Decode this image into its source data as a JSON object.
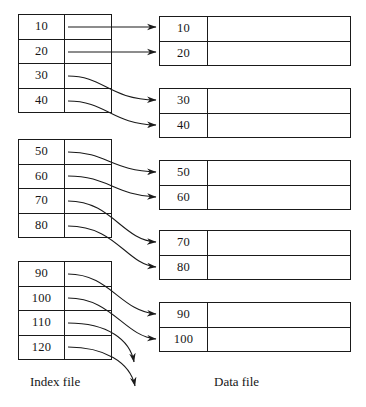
{
  "diagram": {
    "title_labels": {
      "index_file": "Index file",
      "data_file": "Data file"
    },
    "index_file": {
      "blocks": [
        {
          "id": "index-block-1",
          "entries": [
            {
              "key": "10",
              "pointer_icon": "pointer-stub"
            },
            {
              "key": "20",
              "pointer_icon": "pointer-stub"
            },
            {
              "key": "30",
              "pointer_icon": "pointer-stub"
            },
            {
              "key": "40",
              "pointer_icon": "pointer-stub"
            }
          ]
        },
        {
          "id": "index-block-2",
          "entries": [
            {
              "key": "50",
              "pointer_icon": "pointer-stub"
            },
            {
              "key": "60",
              "pointer_icon": "pointer-stub"
            },
            {
              "key": "70",
              "pointer_icon": "pointer-stub"
            },
            {
              "key": "80",
              "pointer_icon": "pointer-stub"
            }
          ]
        },
        {
          "id": "index-block-3",
          "entries": [
            {
              "key": "90",
              "pointer_icon": "pointer-stub"
            },
            {
              "key": "100",
              "pointer_icon": "pointer-stub"
            },
            {
              "key": "110",
              "pointer_icon": "pointer-stub"
            },
            {
              "key": "120",
              "pointer_icon": "pointer-stub"
            }
          ]
        }
      ]
    },
    "data_file": {
      "blocks": [
        {
          "id": "data-block-1",
          "records": [
            {
              "key": "10"
            },
            {
              "key": "20"
            }
          ]
        },
        {
          "id": "data-block-2",
          "records": [
            {
              "key": "30"
            },
            {
              "key": "40"
            }
          ]
        },
        {
          "id": "data-block-3",
          "records": [
            {
              "key": "50"
            },
            {
              "key": "60"
            }
          ]
        },
        {
          "id": "data-block-4",
          "records": [
            {
              "key": "70"
            },
            {
              "key": "80"
            }
          ]
        },
        {
          "id": "data-block-5",
          "records": [
            {
              "key": "90"
            },
            {
              "key": "100"
            }
          ]
        }
      ]
    },
    "pointers": [
      {
        "from": "10",
        "to": "data-record-10",
        "style": "straight"
      },
      {
        "from": "20",
        "to": "data-record-20",
        "style": "straight"
      },
      {
        "from": "30",
        "to": "data-record-30",
        "style": "curve-down"
      },
      {
        "from": "40",
        "to": "data-record-40",
        "style": "curve-down"
      },
      {
        "from": "50",
        "to": "data-record-50",
        "style": "curve-down"
      },
      {
        "from": "60",
        "to": "data-record-60",
        "style": "curve-down"
      },
      {
        "from": "70",
        "to": "data-record-70",
        "style": "curve-down"
      },
      {
        "from": "80",
        "to": "data-record-80",
        "style": "curve-down"
      },
      {
        "from": "90",
        "to": "data-record-90",
        "style": "curve-down"
      },
      {
        "from": "100",
        "to": "data-record-100",
        "style": "curve-down"
      },
      {
        "from": "110",
        "to": "off-page",
        "style": "curve-down-dangling"
      },
      {
        "from": "120",
        "to": "off-page",
        "style": "curve-down-dangling"
      }
    ],
    "colors": {
      "line": "#1a1a1a",
      "background": "#ffffff",
      "text": "#161616"
    }
  }
}
